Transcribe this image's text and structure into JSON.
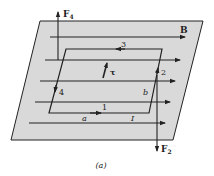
{
  "figure": {
    "caption": "(a)",
    "plane_fill": "#d9d9d9",
    "line_color": "#222222",
    "labels": {
      "force_top": "F",
      "force_top_sub": "4",
      "force_bottom": "F",
      "force_bottom_sub": "2",
      "field": "B",
      "torque": "τ",
      "side_1": "1",
      "side_2": "2",
      "side_3": "3",
      "side_4": "4",
      "dim_a": "a",
      "dim_b": "b",
      "current": "I"
    }
  }
}
